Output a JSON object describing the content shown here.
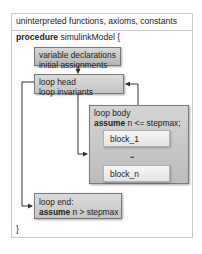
{
  "header": {
    "text": "uninterpreted functions, axioms, constants"
  },
  "procedure": {
    "keyword": "procedure",
    "name": "simulinkModel {",
    "closing": "}"
  },
  "boxes": {
    "var_decl": {
      "line1": "variable declarations",
      "line2": "initial assignments"
    },
    "loop_head": {
      "line1": "loop head",
      "line2": "loop invariants"
    },
    "loop_body": {
      "line1": "loop body",
      "keyword": "assume",
      "condition": "n <= stepmax;"
    },
    "blocks": [
      {
        "label": "block_1"
      },
      {
        "label": "block_n"
      }
    ],
    "ellipsis": "•••",
    "loop_end": {
      "line1": "loop end:",
      "keyword": "assume",
      "condition": "n > stepmax"
    }
  }
}
